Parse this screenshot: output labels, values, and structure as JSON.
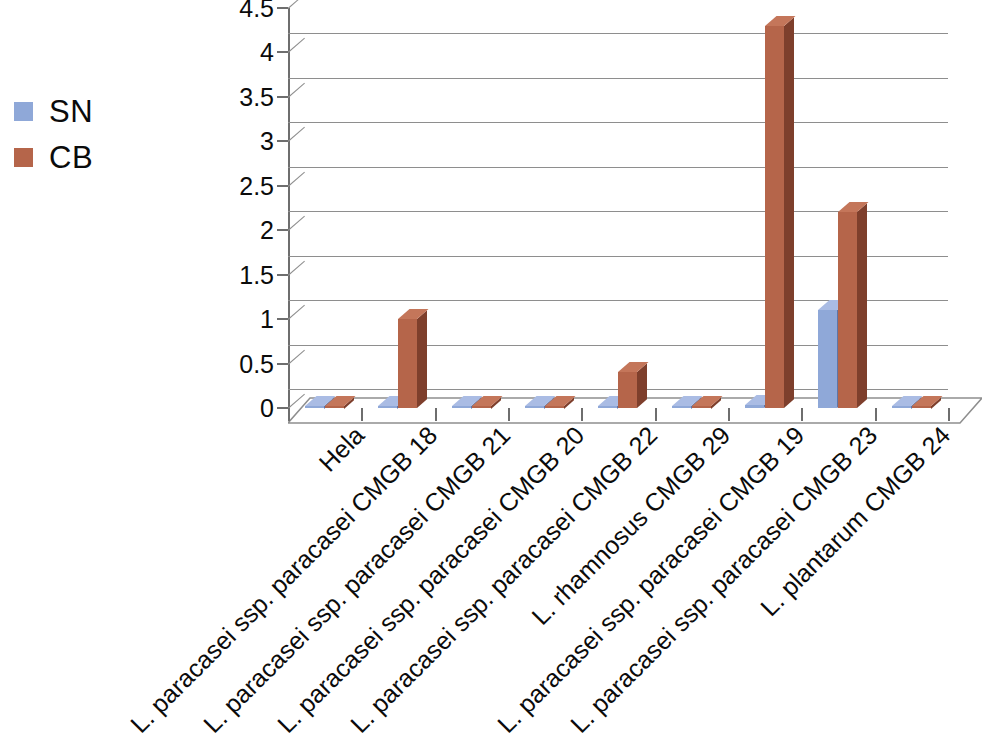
{
  "legend": {
    "position": "top-left-outside",
    "entries": [
      {
        "label": "SN",
        "color": "#8fa8d8",
        "icon": "legend-square-icon"
      },
      {
        "label": "CB",
        "color": "#b5654a",
        "icon": "legend-square-icon"
      }
    ]
  },
  "axes": {
    "y": {
      "ticks": [
        "0",
        "0.5",
        "1",
        "1.5",
        "2",
        "2.5",
        "3",
        "3.5",
        "4",
        "4.5"
      ],
      "min": 0,
      "max": 4.5,
      "step": 0.5,
      "label": ""
    },
    "x": {
      "label": "",
      "tick_rotation": "-45"
    }
  },
  "chart_data": {
    "type": "bar",
    "title": "",
    "subtitle": "",
    "xlabel": "",
    "ylabel": "",
    "ylim": [
      0,
      4.5
    ],
    "ytick_values": [
      0,
      0.5,
      1,
      1.5,
      2,
      2.5,
      3,
      3.5,
      4,
      4.5
    ],
    "grid": true,
    "grid_axis": "y",
    "legend_position": "top-left-outside",
    "style": "3d-clustered-column",
    "categories": [
      "Hela",
      "L. paracasei ssp. paracasei CMGB 18",
      "L. paracasei ssp. paracasei CMGB 21",
      "L. paracasei ssp. paracasei CMGB 20",
      "L. paracasei ssp. paracasei CMGB 22",
      "L. rhamnosus CMGB 29",
      "L. paracasei ssp. paracasei CMGB 19",
      "L. paracasei ssp. paracasei CMGB 23",
      "L. plantarum CMGB 24"
    ],
    "series": [
      {
        "name": "SN",
        "color": "#8fa8d8",
        "values": [
          0.02,
          0.02,
          0.02,
          0.02,
          0.02,
          0.02,
          0.03,
          1.1,
          0.02
        ]
      },
      {
        "name": "CB",
        "color": "#b5654a",
        "values": [
          0.02,
          1.0,
          0.02,
          0.02,
          0.4,
          0.02,
          4.3,
          2.2,
          0.02
        ]
      }
    ]
  }
}
